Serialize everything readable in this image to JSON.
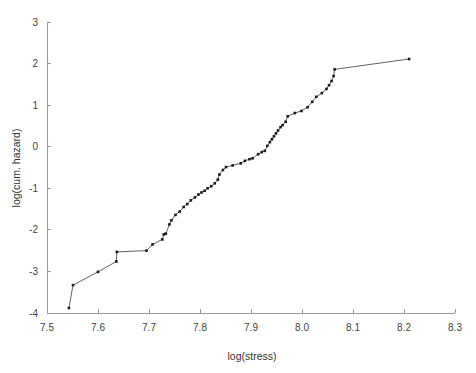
{
  "chart_data": {
    "type": "line",
    "title": "",
    "subtitle": "",
    "xlabel": "log(stress)",
    "ylabel": "log(cum. hazard)",
    "xlim": [
      7.5,
      8.3
    ],
    "ylim": [
      -4,
      3
    ],
    "xticks": [
      7.5,
      7.6,
      7.7,
      7.8,
      7.9,
      8.0,
      8.1,
      8.2,
      8.3
    ],
    "xticklabels": [
      "7.5",
      "7.6",
      "7.7",
      "7.8",
      "7.9",
      "8.0",
      "8.1",
      "8.2",
      "8.3"
    ],
    "yticks": [
      -4,
      -3,
      -2,
      -1,
      0,
      1,
      2,
      3
    ],
    "yticklabels": [
      "-4",
      "-3",
      "-2",
      "-1",
      "0",
      "1",
      "2",
      "3"
    ],
    "grid": false,
    "legend": null,
    "marker": "filled-square",
    "line_color": "#3b3b3b",
    "marker_color": "#1a1a1a",
    "series": [
      {
        "name": "cumulative hazard",
        "x": [
          7.543,
          7.551,
          7.6,
          7.636,
          7.637,
          7.695,
          7.707,
          7.726,
          7.729,
          7.733,
          7.74,
          7.744,
          7.752,
          7.76,
          7.768,
          7.775,
          7.782,
          7.79,
          7.797,
          7.803,
          7.809,
          7.815,
          7.822,
          7.829,
          7.835,
          7.838,
          7.845,
          7.851,
          7.864,
          7.88,
          7.888,
          7.897,
          7.903,
          7.914,
          7.921,
          7.927,
          7.932,
          7.937,
          7.941,
          7.945,
          7.949,
          7.953,
          7.958,
          7.962,
          7.968,
          7.972,
          7.986,
          7.999,
          8.011,
          8.02,
          8.028,
          8.039,
          8.048,
          8.053,
          8.058,
          8.062,
          8.064,
          8.21
        ],
        "y": [
          -3.88,
          -3.33,
          -3.01,
          -2.76,
          -2.53,
          -2.5,
          -2.35,
          -2.23,
          -2.11,
          -2.09,
          -1.87,
          -1.77,
          -1.64,
          -1.56,
          -1.45,
          -1.38,
          -1.29,
          -1.22,
          -1.15,
          -1.1,
          -1.06,
          -1.0,
          -0.95,
          -0.88,
          -0.79,
          -0.67,
          -0.56,
          -0.49,
          -0.45,
          -0.4,
          -0.34,
          -0.3,
          -0.28,
          -0.18,
          -0.13,
          -0.1,
          0.02,
          0.11,
          0.18,
          0.25,
          0.32,
          0.39,
          0.47,
          0.52,
          0.6,
          0.73,
          0.81,
          0.86,
          0.95,
          1.08,
          1.2,
          1.29,
          1.39,
          1.48,
          1.58,
          1.7,
          1.86,
          2.11
        ]
      }
    ]
  },
  "axis": {
    "x_title": "log(stress)",
    "y_title": "log(cum. hazard)"
  }
}
